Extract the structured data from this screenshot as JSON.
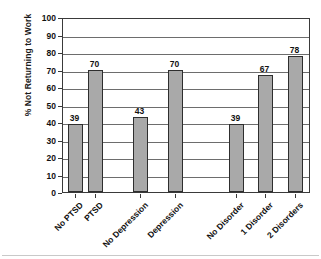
{
  "chart_data": {
    "type": "bar",
    "title": "",
    "xlabel": "",
    "ylabel": "% Not Returning to Work",
    "ylim": [
      0,
      100
    ],
    "ytick_step": 10,
    "grid": true,
    "legend": "none",
    "bar_color": "#a9a9a9",
    "bar_border_color": "#2e2e2e",
    "categories": [
      "No PTSD",
      "PTSD",
      "No Depression",
      "Depression",
      "No Disorder",
      "1 Disorder",
      "2 Disorders"
    ],
    "values": [
      39,
      70,
      43,
      70,
      39,
      67,
      78
    ],
    "ytick_labels": [
      "0",
      "10",
      "20",
      "30",
      "40",
      "50",
      "60",
      "70",
      "80",
      "90",
      "100"
    ],
    "groups": [
      {
        "name": "PTSD",
        "categories": [
          "No PTSD",
          "PTSD"
        ],
        "values": [
          39,
          70
        ]
      },
      {
        "name": "Depression",
        "categories": [
          "No Depression",
          "Depression"
        ],
        "values": [
          43,
          70
        ]
      },
      {
        "name": "Disorder count",
        "categories": [
          "No Disorder",
          "1 Disorder",
          "2 Disorders"
        ],
        "values": [
          39,
          67,
          78
        ]
      }
    ]
  }
}
